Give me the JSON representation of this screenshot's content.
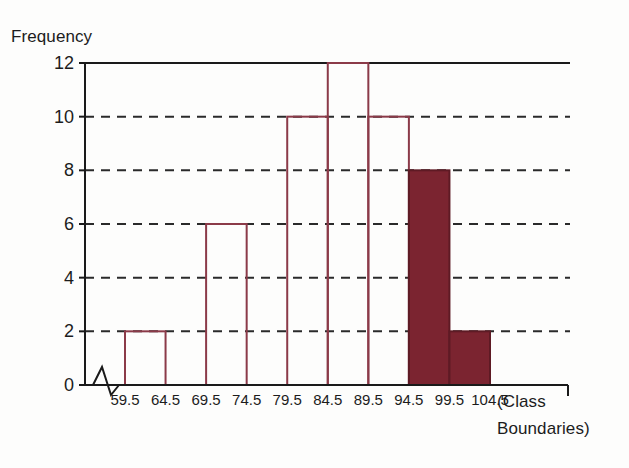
{
  "chart_data": {
    "type": "bar",
    "title": "",
    "subtitle": "",
    "xlabel": "(Class Boundaries)",
    "xlabel_line1": "(Class",
    "xlabel_line2": "Boundaries)",
    "ylabel": "Frequency",
    "ylim": [
      0,
      12
    ],
    "ytick_labels": [
      "0",
      "2",
      "4",
      "6",
      "8",
      "10",
      "12"
    ],
    "ytick_values": [
      0,
      2,
      4,
      6,
      8,
      10,
      12
    ],
    "xtick_labels": [
      "59.5",
      "64.5",
      "69.5",
      "74.5",
      "79.5",
      "84.5",
      "89.5",
      "94.5",
      "99.5",
      "104.5"
    ],
    "class_boundaries": [
      59.5,
      64.5,
      69.5,
      74.5,
      79.5,
      84.5,
      89.5,
      94.5,
      99.5,
      104.5
    ],
    "categories": [
      "59.5-64.5",
      "64.5-69.5",
      "69.5-74.5",
      "74.5-79.5",
      "79.5-84.5",
      "84.5-89.5",
      "89.5-94.5",
      "94.5-99.5",
      "99.5-104.5"
    ],
    "values": [
      2,
      0,
      6,
      0,
      10,
      12,
      10,
      8,
      2
    ],
    "bar_filled": [
      false,
      false,
      false,
      false,
      false,
      false,
      false,
      true,
      true
    ],
    "grid": "horizontal-dashed",
    "gridlines_at": [
      2,
      4,
      6,
      8,
      10
    ],
    "top_border_at": 12,
    "legend": [],
    "axis_break": true,
    "colors": {
      "bar_outline": "#8b3a48",
      "bar_fill": "#7b2430",
      "gridline": "#2a2a2a",
      "axis": "#1a1a1a",
      "background": "#fdfdfc",
      "text": "#1c1c1c"
    }
  }
}
